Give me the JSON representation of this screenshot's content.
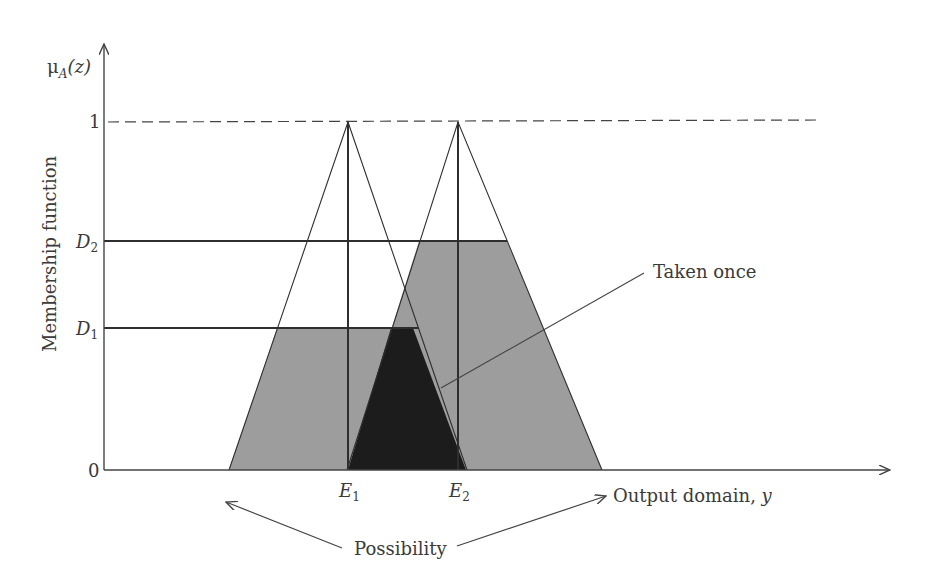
{
  "figure": {
    "y_axis_label": "Membership function",
    "y_axis_symbol": {
      "main": "μ",
      "sub": "A",
      "arg": "(z)"
    },
    "x_axis_label": "Output domain, ",
    "x_axis_var": "y",
    "y_ticks": [
      {
        "label": "1",
        "sub": "",
        "y": 122
      },
      {
        "label": "D",
        "sub": "2",
        "y": 241
      },
      {
        "label": "D",
        "sub": "1",
        "y": 328
      },
      {
        "label": "0",
        "sub": "",
        "y": 470
      }
    ],
    "x_ticks": [
      {
        "label": "E",
        "sub": "1",
        "x": 348
      },
      {
        "label": "E",
        "sub": "2",
        "x": 458
      }
    ],
    "annotations": {
      "taken_once": "Taken once",
      "possibility": "Possibility"
    },
    "colors": {
      "axis": "#444444",
      "line": "#2e2e2e",
      "clip_fill": "#9d9d9d",
      "overlap_fill": "#1c1c1c",
      "text": "#3a3a3a"
    },
    "geometry": {
      "origin": {
        "x": 104,
        "y": 470
      },
      "y_axis_top": 42,
      "x_axis_end": 890,
      "one_level_dash_end": 820,
      "triangle1": {
        "left": 229,
        "apex": 348,
        "right": 467
      },
      "triangle2": {
        "left": 347,
        "apex": 458,
        "right": 602
      },
      "d1_line_end": 418,
      "d2_line_end": 507
    }
  }
}
